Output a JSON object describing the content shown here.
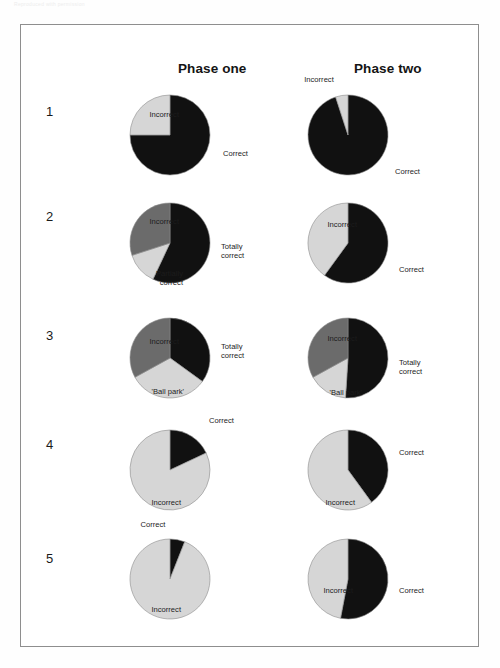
{
  "page": {
    "faint_header_text": "Reproduced with permission",
    "frame_border_color": "#8e8e8e",
    "background_color": "#ffffff"
  },
  "colors": {
    "black": "#111111",
    "dark_gray": "#6b6b6b",
    "light_gray": "#d6d6d6",
    "outline": "#8c8c8c",
    "text": "#1c1c1c"
  },
  "columns": [
    {
      "label": "Phase one"
    },
    {
      "label": "Phase two"
    }
  ],
  "rows": [
    {
      "number": "1"
    },
    {
      "number": "2"
    },
    {
      "number": "3"
    },
    {
      "number": "4"
    },
    {
      "number": "5"
    }
  ],
  "chart_data": [
    {
      "type": "pie",
      "title": "Question 1 — Phase one",
      "row": "1",
      "column": "Phase one",
      "start_angle_deg": 0,
      "direction": "clockwise",
      "slices": [
        {
          "label": "Correct",
          "value": 75,
          "color": "#111111",
          "label_pos": "right",
          "label_x": 100,
          "label_y": 62
        },
        {
          "label": "Incorrect",
          "value": 25,
          "color": "#d6d6d6",
          "label_pos": "left",
          "label_x": -8,
          "label_y": 23
        }
      ]
    },
    {
      "type": "pie",
      "title": "Question 1 — Phase two",
      "row": "1",
      "column": "Phase two",
      "start_angle_deg": 0,
      "direction": "clockwise",
      "slices": [
        {
          "label": "Correct",
          "value": 95,
          "color": "#111111",
          "label_pos": "right",
          "label_x": 94,
          "label_y": 80
        },
        {
          "label": "Incorrect",
          "value": 5,
          "color": "#d6d6d6",
          "label_pos": "center",
          "label_x": 18,
          "label_y": -12
        }
      ]
    },
    {
      "type": "pie",
      "title": "Question 2 — Phase one",
      "row": "2",
      "column": "Phase one",
      "start_angle_deg": 0,
      "direction": "clockwise",
      "slices": [
        {
          "label": "Totally\ncorrect",
          "value": 57,
          "color": "#111111",
          "label_pos": "right",
          "label_x": 98,
          "label_y": 47
        },
        {
          "label": "Partially\ncorrect",
          "value": 13,
          "color": "#d6d6d6",
          "label_pos": "left",
          "label_x": -4,
          "label_y": 74
        },
        {
          "label": "Incorrect",
          "value": 30,
          "color": "#6b6b6b",
          "label_pos": "left",
          "label_x": -8,
          "label_y": 22
        }
      ]
    },
    {
      "type": "pie",
      "title": "Question 2 — Phase two",
      "row": "2",
      "column": "Phase two",
      "start_angle_deg": 0,
      "direction": "clockwise",
      "slices": [
        {
          "label": "Correct",
          "value": 60,
          "color": "#111111",
          "label_pos": "right",
          "label_x": 98,
          "label_y": 70
        },
        {
          "label": "Incorrect",
          "value": 40,
          "color": "#d6d6d6",
          "label_pos": "left",
          "label_x": -8,
          "label_y": 25
        }
      ]
    },
    {
      "type": "pie",
      "title": "Question 3 — Phase one",
      "row": "3",
      "column": "Phase one",
      "start_angle_deg": 0,
      "direction": "clockwise",
      "slices": [
        {
          "label": "Totally\ncorrect",
          "value": 35,
          "color": "#111111",
          "label_pos": "right",
          "label_x": 98,
          "label_y": 32
        },
        {
          "label": "'Ball park'",
          "value": 32,
          "color": "#d6d6d6",
          "label_pos": "left",
          "label_x": -3,
          "label_y": 77
        },
        {
          "label": "Incorrect",
          "value": 33,
          "color": "#6b6b6b",
          "label_pos": "left",
          "label_x": -8,
          "label_y": 27
        }
      ]
    },
    {
      "type": "pie",
      "title": "Question 3 — Phase two",
      "row": "3",
      "column": "Phase two",
      "start_angle_deg": 0,
      "direction": "clockwise",
      "slices": [
        {
          "label": "Totally\ncorrect",
          "value": 51,
          "color": "#111111",
          "label_pos": "right",
          "label_x": 98,
          "label_y": 48
        },
        {
          "label": "'Ball park'",
          "value": 16,
          "color": "#d6d6d6",
          "label_pos": "left",
          "label_x": -3,
          "label_y": 78
        },
        {
          "label": "Incorrect",
          "value": 33,
          "color": "#6b6b6b",
          "label_pos": "left",
          "label_x": -8,
          "label_y": 24
        }
      ]
    },
    {
      "type": "pie",
      "title": "Question 4 — Phase one",
      "row": "4",
      "column": "Phase one",
      "start_angle_deg": 0,
      "direction": "clockwise",
      "slices": [
        {
          "label": "Correct",
          "value": 18,
          "color": "#111111",
          "label_pos": "right",
          "label_x": 86,
          "label_y": -6
        },
        {
          "label": "Incorrect",
          "value": 82,
          "color": "#d6d6d6",
          "label_pos": "left",
          "label_x": -6,
          "label_y": 76
        }
      ]
    },
    {
      "type": "pie",
      "title": "Question 4 — Phase two",
      "row": "4",
      "column": "Phase two",
      "start_angle_deg": 0,
      "direction": "clockwise",
      "slices": [
        {
          "label": "Correct",
          "value": 40,
          "color": "#111111",
          "label_pos": "right",
          "label_x": 98,
          "label_y": 26
        },
        {
          "label": "Incorrect",
          "value": 60,
          "color": "#d6d6d6",
          "label_pos": "left",
          "label_x": -10,
          "label_y": 76
        }
      ]
    },
    {
      "type": "pie",
      "title": "Question 5 — Phase one",
      "row": "5",
      "column": "Phase one",
      "start_angle_deg": 0,
      "direction": "clockwise",
      "slices": [
        {
          "label": "Correct",
          "value": 6,
          "color": "#111111",
          "label_pos": "center",
          "label_x": 30,
          "label_y": -11
        },
        {
          "label": "Incorrect",
          "value": 94,
          "color": "#d6d6d6",
          "label_pos": "left",
          "label_x": -6,
          "label_y": 74
        }
      ]
    },
    {
      "type": "pie",
      "title": "Question 5 — Phase two",
      "row": "5",
      "column": "Phase two",
      "start_angle_deg": 0,
      "direction": "clockwise",
      "slices": [
        {
          "label": "Correct",
          "value": 53,
          "color": "#111111",
          "label_pos": "right",
          "label_x": 98,
          "label_y": 55
        },
        {
          "label": "Incorrect",
          "value": 47,
          "color": "#d6d6d6",
          "label_pos": "left",
          "label_x": -12,
          "label_y": 55
        }
      ]
    }
  ]
}
